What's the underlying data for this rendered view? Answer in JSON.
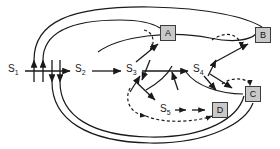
{
  "diagram": {
    "type": "state-transition-graph",
    "width": 280,
    "height": 149,
    "background_color": "#ffffff",
    "stroke_color": "#1a1a1a",
    "box_fill_color": "#c9c9c9",
    "box_border_color": "#3b3b3b",
    "states": [
      {
        "id": "s1",
        "label": "S",
        "subscript": "1",
        "x": 8,
        "y": 64
      },
      {
        "id": "s2",
        "label": "S",
        "subscript": "2",
        "x": 75,
        "y": 64
      },
      {
        "id": "s3",
        "label": "S",
        "subscript": "3",
        "x": 126,
        "y": 64
      },
      {
        "id": "s4",
        "label": "S",
        "subscript": "4",
        "x": 193,
        "y": 64
      },
      {
        "id": "s5",
        "label": "S",
        "subscript": "5",
        "x": 160,
        "y": 104
      }
    ],
    "terminals": [
      {
        "id": "a",
        "label": "A",
        "x": 160,
        "y": 25
      },
      {
        "id": "b",
        "label": "B",
        "x": 255,
        "y": 27
      },
      {
        "id": "c",
        "label": "C",
        "x": 245,
        "y": 86
      },
      {
        "id": "d",
        "label": "D",
        "x": 212,
        "y": 102
      }
    ],
    "edges": [
      {
        "from": "s1",
        "to": "s2",
        "style": "solid"
      },
      {
        "from": "s2",
        "to": "s3",
        "style": "solid"
      },
      {
        "from": "s3",
        "to": "s4",
        "style": "solid"
      },
      {
        "from": "s3",
        "to": "a",
        "style": "solid"
      },
      {
        "from": "s3",
        "to": "s5",
        "style": "solid"
      },
      {
        "from": "s5",
        "to": "d",
        "style": "solid"
      },
      {
        "from": "s4",
        "to": "b",
        "style": "solid"
      },
      {
        "from": "s4",
        "to": "c",
        "style": "solid"
      },
      {
        "from": "s3",
        "to": "a",
        "style": "dashed"
      },
      {
        "from": "s3",
        "to": "s5",
        "style": "dashed"
      },
      {
        "from": "s4",
        "to": "b",
        "style": "dashed"
      },
      {
        "from": "s4",
        "to": "c",
        "style": "dashed"
      },
      {
        "from": "d",
        "to": "s3",
        "style": "dashed"
      },
      {
        "from": "b",
        "to": "s1",
        "style": "solid"
      },
      {
        "from": "a",
        "to": "s1",
        "style": "solid"
      },
      {
        "from": "c",
        "to": "s1",
        "style": "solid"
      },
      {
        "from": "d",
        "to": "s1",
        "style": "solid"
      }
    ]
  }
}
